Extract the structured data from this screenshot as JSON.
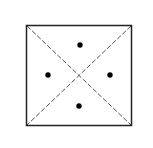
{
  "diagram": {
    "shape": "square",
    "square": {
      "x": 26,
      "y": 25,
      "width": 106,
      "height": 101,
      "stroke": "#222222"
    },
    "diagonals": {
      "style": "dashed",
      "stroke": "#444444"
    },
    "dots": [
      {
        "name": "top",
        "cx": 80,
        "cy": 45
      },
      {
        "name": "left",
        "cx": 48,
        "cy": 75
      },
      {
        "name": "right",
        "cx": 110,
        "cy": 75
      },
      {
        "name": "bottom",
        "cx": 79,
        "cy": 106
      }
    ],
    "dot_color": "#000000"
  }
}
